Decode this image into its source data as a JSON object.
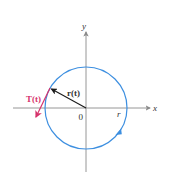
{
  "diagram": {
    "colors": {
      "axes": "#8a8a8a",
      "circle": "#3d8fe0",
      "position_vector": "#1a1a1a",
      "tangent_vector": "#d6336c",
      "text": "#333333"
    },
    "axes": {
      "x_label": "x",
      "y_label": "y",
      "origin_label": "0"
    },
    "circle": {
      "radius_label": "r",
      "direction": "clockwise"
    },
    "vectors": {
      "position_label": "r(t)",
      "tangent_label": "T(t)"
    }
  }
}
